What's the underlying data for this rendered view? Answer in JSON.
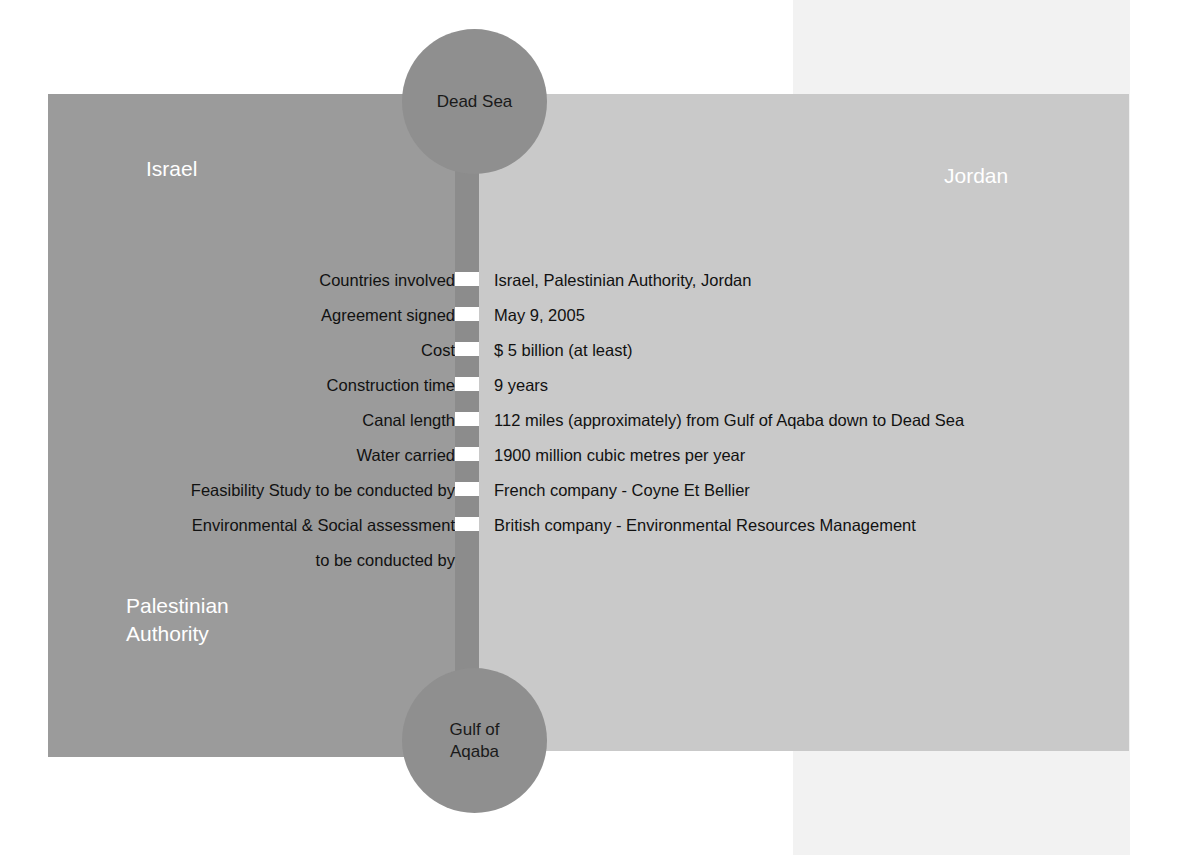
{
  "figure": {
    "colors": {
      "israel_panel": "#9b9b9b",
      "jordan_panel": "#c9c9c9",
      "canal_strip": "#8c8c8c",
      "sea_circle": "#8f8f8f",
      "pale_column": "#f2f2f2",
      "dash_marker": "#ffffff",
      "label_text": "#111111",
      "country_text": "#ffffff"
    }
  },
  "regions": {
    "israel": "Israel",
    "jordan": "Jordan",
    "palestinian_authority_line1": "Palestinian",
    "palestinian_authority_line2": "Authority"
  },
  "water_bodies": {
    "north": "Dead Sea",
    "south_line1": "Gulf of",
    "south_line2": "Aqaba"
  },
  "facts": [
    {
      "label": "Countries involved",
      "value": "Israel, Palestinian Authority, Jordan"
    },
    {
      "label": "Agreement signed",
      "value": "May 9, 2005"
    },
    {
      "label": "Cost",
      "value": "$ 5 billion (at least)"
    },
    {
      "label": "Construction time",
      "value": "9 years"
    },
    {
      "label": "Canal length",
      "value": "112 miles (approximately) from Gulf of Aqaba down to Dead Sea"
    },
    {
      "label": "Water carried",
      "value": "1900 million cubic metres per year"
    },
    {
      "label": "Feasibility Study to be conducted by",
      "value": "French company - Coyne Et Bellier"
    },
    {
      "label": "Environmental & Social assessment",
      "value": "British company - Environmental Resources Management",
      "label_continuation": "to be conducted by"
    }
  ]
}
